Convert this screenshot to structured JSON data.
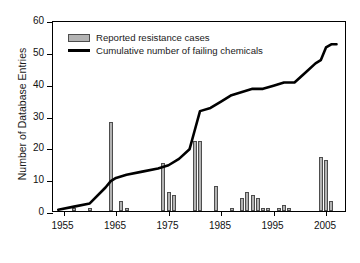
{
  "chart_data": {
    "type": "bar",
    "title": "",
    "xlabel": "",
    "ylabel": "Number of Database Entries",
    "xlim": [
      1953,
      2009
    ],
    "ylim": [
      0,
      60
    ],
    "grid": false,
    "legend_position": "top-left",
    "y_ticks": [
      0,
      10,
      20,
      30,
      40,
      50,
      60
    ],
    "x_ticks": [
      1955,
      1965,
      1975,
      1985,
      1995,
      2005
    ],
    "x_tick_labels": [
      "1955",
      "1965",
      "1975",
      "1985",
      "1995",
      "2005"
    ],
    "y_tick_labels": [
      "0",
      "10",
      "20",
      "30",
      "40",
      "50",
      "60"
    ],
    "colors": {
      "bar_fill": "#b3b3b3",
      "bar_edge": "#4d4d4d",
      "line": "#000000",
      "axis": "#000000",
      "background": "#ffffff"
    },
    "series": [
      {
        "name": "Reported resistance cases",
        "type": "bar",
        "x": [
          1957,
          1960,
          1964,
          1966,
          1967,
          1974,
          1975,
          1976,
          1980,
          1981,
          1984,
          1987,
          1989,
          1990,
          1991,
          1992,
          1993,
          1994,
          1996,
          1997,
          1998,
          2004,
          2005,
          2006
        ],
        "values": [
          1,
          1,
          28,
          3,
          1,
          15,
          6,
          5,
          22,
          22,
          8,
          1,
          4,
          6,
          5,
          4,
          1,
          1,
          1,
          2,
          1,
          17,
          16,
          3
        ]
      },
      {
        "name": "Cumulative number of failing chemicals",
        "type": "line",
        "x": [
          1954,
          1957,
          1960,
          1963,
          1964,
          1965,
          1967,
          1970,
          1973,
          1975,
          1977,
          1979,
          1980,
          1981,
          1983,
          1985,
          1987,
          1989,
          1991,
          1993,
          1995,
          1997,
          1999,
          2001,
          2003,
          2004,
          2005,
          2006,
          2007
        ],
        "values": [
          1,
          2,
          3,
          8,
          10,
          11,
          12,
          13,
          14,
          15,
          17,
          20,
          26,
          32,
          33,
          35,
          37,
          38,
          39,
          39,
          40,
          41,
          41,
          44,
          47,
          48,
          52,
          53,
          53
        ]
      }
    ]
  },
  "legend": {
    "entries": [
      {
        "label": "Reported resistance cases",
        "marker": "bar-swatch"
      },
      {
        "label": "Cumulative number of failing chemicals",
        "marker": "line-swatch"
      }
    ]
  }
}
